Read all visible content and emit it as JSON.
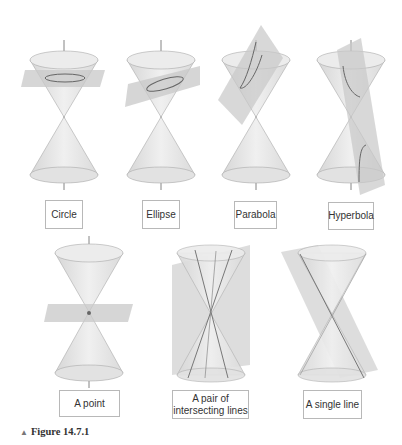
{
  "figure": {
    "caption_marker": "▲",
    "caption": "Figure 14.7.1",
    "panels": [
      {
        "label": "Circle"
      },
      {
        "label": "Ellipse"
      },
      {
        "label": "Parabola"
      },
      {
        "label": "Hyperbola"
      },
      {
        "label": "A point"
      },
      {
        "label_line1": "A pair of",
        "label_line2": "intersecting lines"
      },
      {
        "label": "A single line"
      }
    ]
  },
  "colors": {
    "cone": "#e6e6e6",
    "plane": "#cfcfcf",
    "axis": "#555555",
    "curve": "#666666",
    "border": "#b8b8b8"
  }
}
